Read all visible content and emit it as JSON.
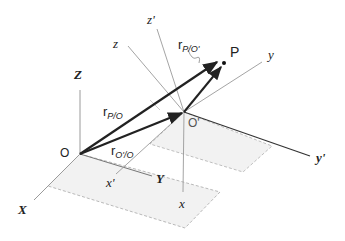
{
  "diagram": {
    "title": "",
    "colors": {
      "axis_thin": "#9a9a9a",
      "axis_dark": "#333333",
      "vector": "#222222",
      "plane_fill": "#f1f1f1",
      "plane_edge": "#a8a8a8"
    },
    "points": {
      "origin": "O",
      "moving_origin": "O'",
      "particle": "P"
    },
    "fixed_axes": {
      "X": "X",
      "Y": "Y",
      "Z": "Z"
    },
    "translated_axes": {
      "x": "x",
      "y": "y",
      "z": "z"
    },
    "rotated_axes": {
      "x_prime": "x'",
      "y_prime": "y'",
      "z_prime": "z'"
    },
    "vectors": {
      "r_P_O": {
        "base": "r",
        "sub": "P/O"
      },
      "r_Oprime_O": {
        "base": "r",
        "sub": "O'/O"
      },
      "r_P_Oprime": {
        "base": "r",
        "sub": "P/O'"
      }
    }
  }
}
